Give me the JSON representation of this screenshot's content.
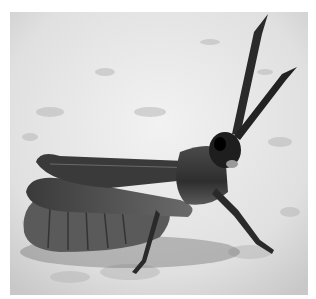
{
  "image": {
    "subject": "grasshopper",
    "style": "black-and-white photograph",
    "border_color": "#ffffff",
    "background_tone": "#e6e6e6",
    "subject_tone": "#3a3a3a"
  }
}
